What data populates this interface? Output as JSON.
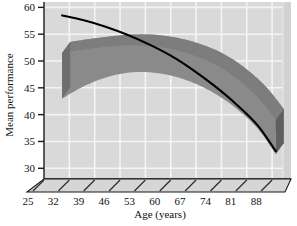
{
  "chart_data": {
    "type": "line",
    "title": "",
    "xlabel": "Age (years)",
    "ylabel": "Mean performance",
    "xlim": [
      25,
      91
    ],
    "ylim": [
      28,
      61
    ],
    "xticks": [
      25,
      32,
      39,
      46,
      53,
      60,
      67,
      74,
      81,
      88
    ],
    "yticks": [
      30,
      35,
      40,
      45,
      50,
      55,
      60
    ],
    "grid": true,
    "legend": "none",
    "style": "3d-ribbon",
    "series": [
      {
        "name": "Declining curve",
        "type": "line",
        "color": "#000000",
        "x": [
          30,
          36,
          42,
          48,
          54,
          60,
          66,
          72,
          78,
          84,
          89
        ],
        "y": [
          58.5,
          57.6,
          56.4,
          54.9,
          53.1,
          51.0,
          48.4,
          45.4,
          42.0,
          38.0,
          33.2
        ]
      },
      {
        "name": "Inverted-U band upper bound",
        "type": "band-upper",
        "color": "#8a8a8a",
        "x": [
          30,
          36,
          42,
          48,
          54,
          60,
          66,
          72,
          78,
          84,
          89
        ],
        "y": [
          51.5,
          52.1,
          52.6,
          52.9,
          52.8,
          52.2,
          51.1,
          49.4,
          46.8,
          43.2,
          39.0
        ]
      },
      {
        "name": "Inverted-U band lower bound",
        "type": "band-lower",
        "color": "#8a8a8a",
        "x": [
          30,
          36,
          42,
          48,
          54,
          60,
          66,
          72,
          78,
          84,
          89
        ],
        "y": [
          43.0,
          45.3,
          46.9,
          47.8,
          47.9,
          47.3,
          46.0,
          44.0,
          41.2,
          37.4,
          32.6
        ]
      }
    ],
    "annotations": []
  },
  "colors": {
    "plot_background": "#d9d9d9",
    "gridline": "#f4f4f4",
    "band_fill": "#8a8a8a",
    "band_side_face": "#6e6e6e",
    "floor": "#d0d0d0",
    "axis_line": "#1a1a1a",
    "curve": "#000000",
    "page_background": "#ffffff",
    "text": "#111111"
  },
  "axes": {
    "y": {
      "label": "Mean performance",
      "tick_labels": [
        "60",
        "55",
        "50",
        "45",
        "40",
        "35",
        "30"
      ]
    },
    "x": {
      "label": "Age (years)",
      "tick_labels": [
        "25",
        "32",
        "39",
        "46",
        "53",
        "60",
        "67",
        "74",
        "81",
        "88"
      ]
    }
  }
}
